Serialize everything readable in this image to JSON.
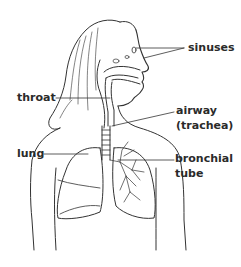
{
  "diagram": {
    "type": "anatomy-respiratory-system",
    "labels": {
      "sinuses": "sinuses",
      "throat": "throat",
      "airway_line1": "airway",
      "airway_line2": "(trachea)",
      "lung": "lung",
      "bronchial_line1": "bronchial",
      "bronchial_line2": "tube"
    },
    "colors": {
      "background": "#ffffff",
      "line": "#333333",
      "text": "#2a2a2a"
    }
  }
}
